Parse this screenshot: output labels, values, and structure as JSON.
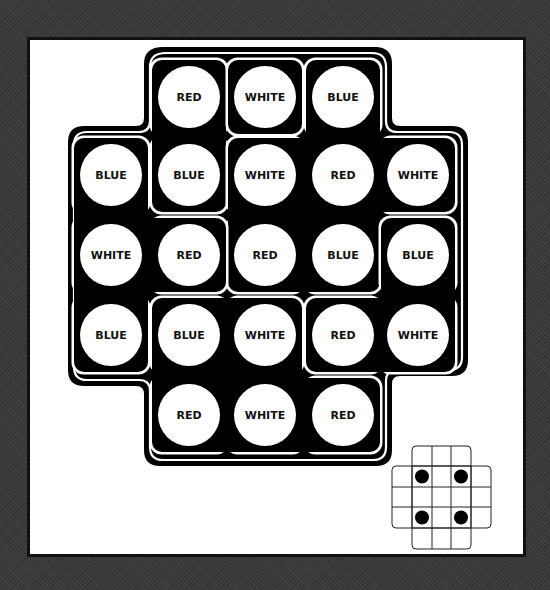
{
  "puzzle": {
    "colors": {
      "background": "#3a3a3a",
      "panel": "#ffffff",
      "board": "#000000",
      "peg": "#ffffff",
      "text": "#111111"
    },
    "grid": {
      "col_x": [
        111,
        189,
        265,
        343,
        418
      ],
      "row_y": [
        97,
        175,
        255,
        335,
        415
      ]
    },
    "pieces": [
      {
        "id": "piece-1",
        "cells": [
          {
            "col": 1,
            "row": 0,
            "label": "RED"
          },
          {
            "col": 1,
            "row": 1,
            "label": "BLUE"
          }
        ]
      },
      {
        "id": "piece-2",
        "cells": [
          {
            "col": 2,
            "row": 0,
            "label": "WHITE"
          }
        ]
      },
      {
        "id": "piece-3",
        "cells": [
          {
            "col": 3,
            "row": 0,
            "label": "BLUE"
          },
          {
            "col": 2,
            "row": 1,
            "label": "WHITE"
          },
          {
            "col": 3,
            "row": 1,
            "label": "RED"
          },
          {
            "col": 4,
            "row": 1,
            "label": "WHITE"
          },
          {
            "col": 2,
            "row": 2,
            "label": "RED"
          },
          {
            "col": 3,
            "row": 2,
            "label": "BLUE"
          }
        ]
      },
      {
        "id": "piece-4",
        "cells": [
          {
            "col": 0,
            "row": 1,
            "label": "BLUE"
          },
          {
            "col": 0,
            "row": 2,
            "label": "WHITE"
          },
          {
            "col": 1,
            "row": 2,
            "label": "RED"
          },
          {
            "col": 0,
            "row": 3,
            "label": "BLUE"
          }
        ]
      },
      {
        "id": "piece-5",
        "cells": [
          {
            "col": 4,
            "row": 2,
            "label": "BLUE"
          },
          {
            "col": 3,
            "row": 3,
            "label": "RED"
          },
          {
            "col": 4,
            "row": 3,
            "label": "WHITE"
          }
        ]
      },
      {
        "id": "piece-6",
        "cells": [
          {
            "col": 1,
            "row": 3,
            "label": "BLUE"
          },
          {
            "col": 2,
            "row": 3,
            "label": "WHITE"
          },
          {
            "col": 1,
            "row": 4,
            "label": "RED"
          },
          {
            "col": 2,
            "row": 4,
            "label": "WHITE"
          },
          {
            "col": 3,
            "row": 4,
            "label": "RED"
          }
        ]
      }
    ],
    "legend_diagram": {
      "dots": [
        {
          "col": 1,
          "row": 1
        },
        {
          "col": 3,
          "row": 1
        },
        {
          "col": 1,
          "row": 3
        },
        {
          "col": 3,
          "row": 3
        }
      ]
    }
  }
}
